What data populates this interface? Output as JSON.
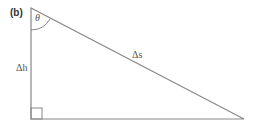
{
  "figure": {
    "panel_label": "(b)",
    "angle_label": "θ",
    "vertical_side_label": "Δh",
    "hypotenuse_label": "Δs",
    "right_angle_marker": true,
    "line_color": "#888888"
  }
}
